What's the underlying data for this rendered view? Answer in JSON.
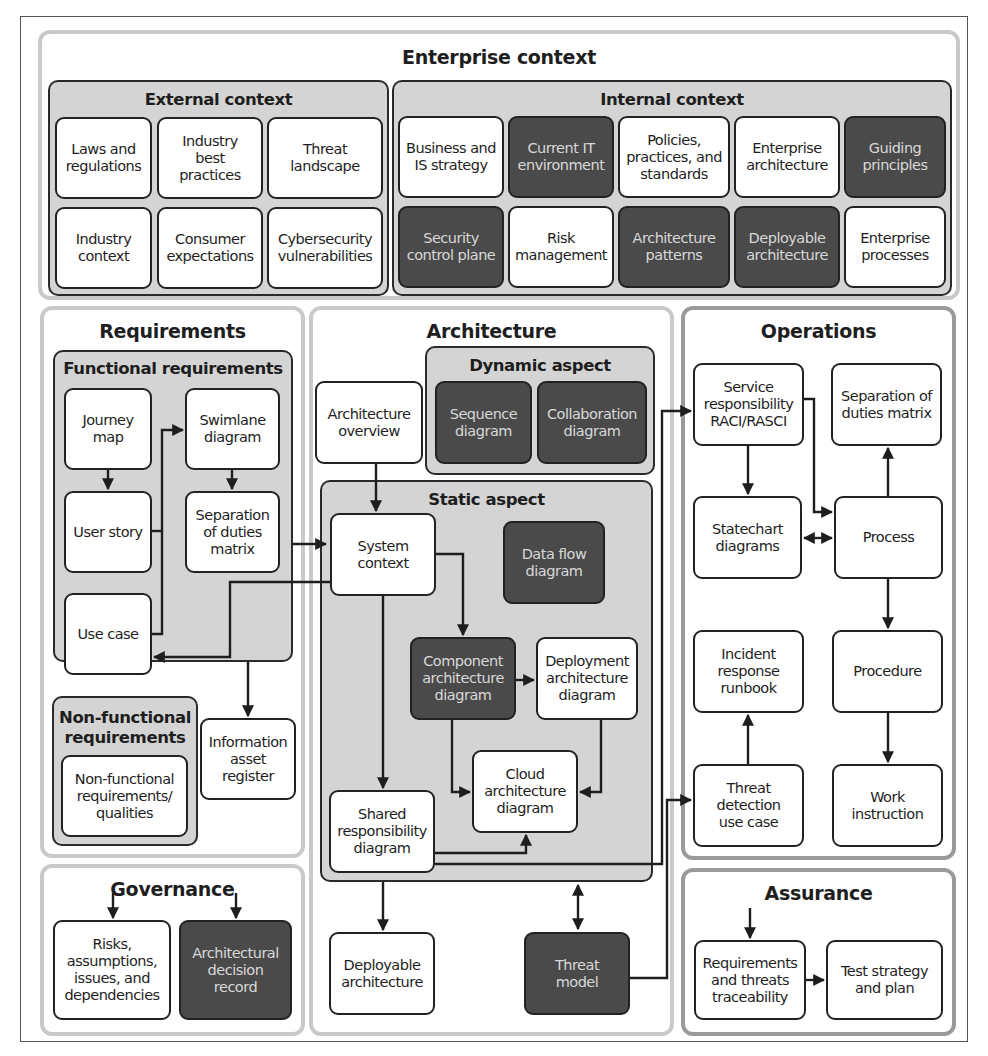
{
  "enterprise_context": {
    "title": "Enterprise context",
    "external": {
      "title": "External context",
      "items": [
        {
          "label": "Laws and\nregulations",
          "shade": "light"
        },
        {
          "label": "Industry\nbest\npractices",
          "shade": "light"
        },
        {
          "label": "Threat\nlandscape",
          "shade": "light"
        },
        {
          "label": "Industry\ncontext",
          "shade": "light"
        },
        {
          "label": "Consumer\nexpectations",
          "shade": "light"
        },
        {
          "label": "Cybersecurity\nvulnerabilities",
          "shade": "light"
        }
      ]
    },
    "internal": {
      "title": "Internal context",
      "items": [
        {
          "label": "Business and\nIS strategy",
          "shade": "light"
        },
        {
          "label": "Current IT\nenvironment",
          "shade": "dark"
        },
        {
          "label": "Policies,\npractices, and\nstandards",
          "shade": "light"
        },
        {
          "label": "Enterprise\narchitecture",
          "shade": "light"
        },
        {
          "label": "Guiding\nprinciples",
          "shade": "dark"
        },
        {
          "label": "Security\ncontrol plane",
          "shade": "dark"
        },
        {
          "label": "Risk\nmanagement",
          "shade": "light"
        },
        {
          "label": "Architecture\npatterns",
          "shade": "dark"
        },
        {
          "label": "Deployable\narchitecture",
          "shade": "dark"
        },
        {
          "label": "Enterprise\nprocesses",
          "shade": "light"
        }
      ]
    }
  },
  "requirements": {
    "title": "Requirements",
    "functional": {
      "title": "Functional requirements",
      "journey_map": "Journey\nmap",
      "user_story": "User story",
      "use_case": "Use case",
      "swimlane": "Swimlane\ndiagram",
      "sod_matrix": "Separation\nof duties\nmatrix"
    },
    "non_functional": {
      "title": "Non-functional\nrequirements",
      "item": "Non-functional\nrequirements/\nqualities"
    },
    "info_asset_register": "Information\nasset\nregister"
  },
  "governance": {
    "title": "Governance",
    "raid": "Risks,\nassumptions,\nissues, and\ndependencies",
    "adr": "Architectural\ndecision\nrecord"
  },
  "architecture": {
    "title": "Architecture",
    "overview": "Architecture\noverview",
    "dynamic": {
      "title": "Dynamic aspect",
      "sequence": "Sequence\ndiagram",
      "collaboration": "Collaboration\ndiagram"
    },
    "static": {
      "title": "Static aspect",
      "system_context": "System\ncontext",
      "data_flow": "Data flow\ndiagram",
      "component": "Component\narchitecture\ndiagram",
      "deployment": "Deployment\narchitecture\ndiagram",
      "cloud": "Cloud\narchitecture\ndiagram",
      "shared_responsibility": "Shared\nresponsibility\ndiagram"
    },
    "deployable": "Deployable\narchitecture",
    "threat_model": "Threat\nmodel"
  },
  "operations": {
    "title": "Operations",
    "service_raci": "Service\nresponsibility\nRACI/RASCI",
    "sod_matrix": "Separation of\nduties matrix",
    "statechart": "Statechart\ndiagrams",
    "process": "Process",
    "incident_runbook": "Incident\nresponse\nrunbook",
    "procedure": "Procedure",
    "threat_detection": "Threat\ndetection\nuse case",
    "work_instruction": "Work\ninstruction"
  },
  "assurance": {
    "title": "Assurance",
    "traceability": "Requirements\nand threats\ntraceability",
    "test_strategy": "Test strategy\nand plan"
  },
  "colors": {
    "dark_box": "#4a4a4a",
    "group_fill": "#d4d4d4",
    "outer_border": "#c9c9c9",
    "line": "#1e1e1e"
  }
}
